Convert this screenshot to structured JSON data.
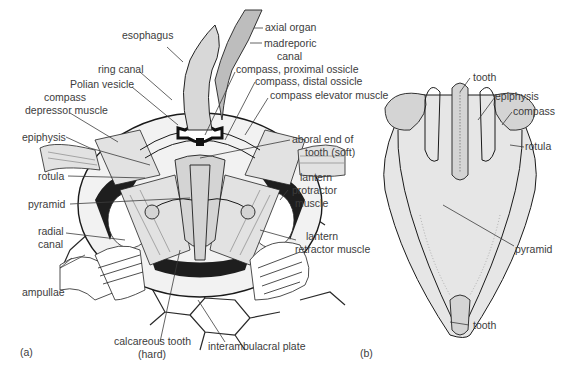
{
  "figure": {
    "panel_a": {
      "panel_label": "(a)",
      "labels": {
        "esophagus": "esophagus",
        "axial_organ": "axial organ",
        "madreporic_canal_1": "madreporic",
        "madreporic_canal_2": "canal",
        "ring_canal": "ring canal",
        "polian_vesicle": "Polian vesicle",
        "compass_proximal": "compass, proximal ossicle",
        "compass_distal": "compass, distal ossicle",
        "compass_elevator": "compass elevator muscle",
        "compass_depressor_1": "compass",
        "compass_depressor_2": "depressor muscle",
        "epiphysis": "epiphysis",
        "aboral_end_1": "aboral end of",
        "aboral_end_2": "tooth (soft)",
        "rotula": "rotula",
        "lantern_protractor_1": "lantern",
        "lantern_protractor_2": "protractor",
        "lantern_protractor_3": "muscle",
        "pyramid": "pyramid",
        "radial_canal_1": "radial",
        "radial_canal_2": "canal",
        "lantern_retractor_1": "lantern",
        "lantern_retractor_2": "retractor muscle",
        "ampullae": "ampullae",
        "calcareous_tooth_1": "calcareous tooth",
        "calcareous_tooth_2": "(hard)",
        "interambulacral_plate": "interambulacral plate"
      }
    },
    "panel_b": {
      "panel_label": "(b)",
      "labels": {
        "tooth_top": "tooth",
        "epiphysis": "epiphysis",
        "compass": "compass",
        "rotula": "rotula",
        "pyramid": "pyramid",
        "tooth_bottom": "tooth"
      }
    }
  }
}
